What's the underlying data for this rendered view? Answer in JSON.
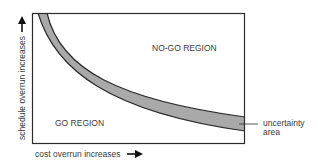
{
  "diagram": {
    "regions": {
      "no_go": "NO-GO REGION",
      "go": "GO REGION"
    },
    "band_label_line1": "uncertainty",
    "band_label_line2": "area",
    "x_axis_label": "cost overrun increases",
    "y_axis_label": "schedule overrun increases",
    "colors": {
      "band_fill": "#a9a9a9",
      "line": "#2b2b2b",
      "text": "#3a3a3a"
    }
  }
}
